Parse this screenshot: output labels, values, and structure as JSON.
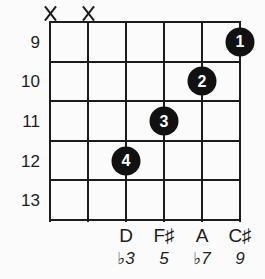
{
  "colors": {
    "background": "#fbfbfb",
    "line": "#1c1c1c",
    "dot_fill": "#111111",
    "dot_text": "#ffffff",
    "text": "#1c1c1c"
  },
  "fretboard": {
    "string_count": 6,
    "fret_row_count": 5,
    "fret_numbers": [
      "9",
      "10",
      "11",
      "12",
      "13"
    ]
  },
  "muted_marks": [
    {
      "string_index": 0,
      "symbol": "X"
    },
    {
      "string_index": 1,
      "symbol": "X"
    }
  ],
  "finger_dots": [
    {
      "string_index": 5,
      "fret_index": 0,
      "finger": "1"
    },
    {
      "string_index": 4,
      "fret_index": 1,
      "finger": "2"
    },
    {
      "string_index": 3,
      "fret_index": 2,
      "finger": "3"
    },
    {
      "string_index": 2,
      "fret_index": 3,
      "finger": "4"
    }
  ],
  "note_labels": [
    {
      "string_index": 2,
      "note": "D",
      "interval": "♭3"
    },
    {
      "string_index": 3,
      "note": "F♯",
      "interval": "5"
    },
    {
      "string_index": 4,
      "note": "A",
      "interval": "♭7"
    },
    {
      "string_index": 5,
      "note": "C♯",
      "interval": "9"
    }
  ]
}
